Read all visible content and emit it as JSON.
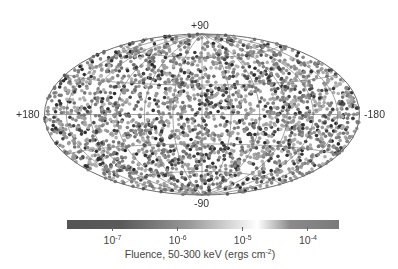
{
  "chart_data": {
    "type": "scatter",
    "title": "",
    "projection": "Hammer-Aitoff (galactic coordinates)",
    "axis_labels": {
      "top": "+90",
      "bottom": "-90",
      "left": "+180",
      "right": "-180"
    },
    "grid": {
      "parallels_deg": [
        -60,
        -30,
        0,
        30,
        60
      ],
      "meridians_deg": [
        -150,
        -120,
        -90,
        -60,
        -30,
        0,
        30,
        60,
        90,
        120,
        150
      ],
      "on": true
    },
    "points": {
      "count_approx": 2700,
      "distribution": "isotropic",
      "marker": "circle",
      "color_encoding": "fluence"
    },
    "colorbar": {
      "label_prefix": "Fluence, 50-300 keV (ergs cm",
      "label_exp": "-2",
      "label_suffix": ")",
      "scale": "log",
      "range": [
        2e-08,
        0.0003
      ],
      "ticks": [
        {
          "base": "10",
          "exp": "-7",
          "value": 1e-07
        },
        {
          "base": "10",
          "exp": "-6",
          "value": 1e-06
        },
        {
          "base": "10",
          "exp": "-5",
          "value": 1e-05
        },
        {
          "base": "10",
          "exp": "-4",
          "value": 0.0001
        }
      ],
      "colors": [
        "#555555",
        "#5a5a5a",
        "#999999",
        "#ffffff",
        "#8a8a8a",
        "#7a7a7a"
      ]
    }
  },
  "colors": {
    "grid_line": "#7a7a7a",
    "outline": "#6a6a6a",
    "background": "#ffffff"
  }
}
